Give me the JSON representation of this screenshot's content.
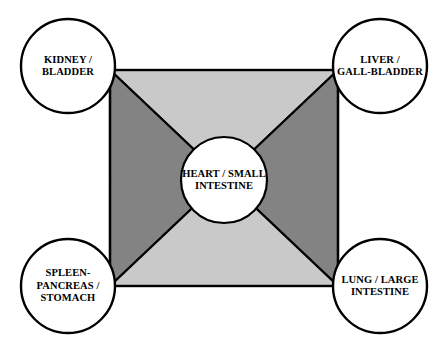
{
  "diagram": {
    "type": "five-phase-organ-correspondence-diagram",
    "shape": {
      "rect": {
        "x": 110,
        "y": 70,
        "width": 228,
        "height": 216
      },
      "center": {
        "x": 224,
        "y": 178
      }
    },
    "colors": {
      "light_gray": "#c9c9c9",
      "dark_gray": "#838383",
      "outline": "#000000",
      "node_fill": "#ffffff",
      "text": "#000000"
    },
    "regions": [
      {
        "name": "top-region",
        "shade": "light",
        "fill": "#c9c9c9"
      },
      {
        "name": "left-region",
        "shade": "dark",
        "fill": "#838383"
      },
      {
        "name": "right-region",
        "shade": "dark",
        "fill": "#838383"
      },
      {
        "name": "bottom-region",
        "shade": "light",
        "fill": "#c9c9c9"
      }
    ],
    "nodes": {
      "center": {
        "id": "heart-small-intestine",
        "label": "HEART / SMALL\nINTESTINE",
        "cx": 224,
        "cy": 180,
        "r": 43
      },
      "corners": [
        {
          "id": "kidney-bladder",
          "label": "KIDNEY /\nBLADDER",
          "position": "top-left",
          "cx": 68,
          "cy": 66,
          "r": 47
        },
        {
          "id": "liver-gallbladder",
          "label": "LIVER /\nGALL-BLADDER",
          "position": "top-right",
          "cx": 380,
          "cy": 66,
          "r": 47
        },
        {
          "id": "spleen-pancreas-stomach",
          "label": "SPLEEN-\nPANCREAS /\nSTOMACH",
          "position": "bottom-left",
          "cx": 68,
          "cy": 286,
          "r": 47
        },
        {
          "id": "lung-large-intestine",
          "label": "LUNG / LARGE\nINTESTINE",
          "position": "bottom-right",
          "cx": 380,
          "cy": 286,
          "r": 47
        }
      ]
    }
  }
}
